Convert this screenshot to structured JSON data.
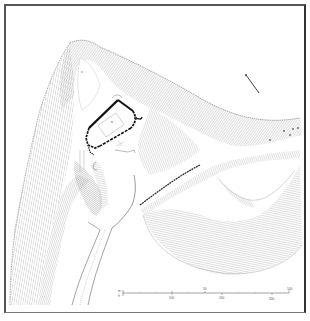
{
  "figure": {
    "type": "earthwork survey plan",
    "colors": {
      "ink": "#222222",
      "hachure": "#9a9a9a",
      "frame": "#555555",
      "background": "#ffffff"
    }
  },
  "north_arrow": {
    "icon": "north-arrow-icon"
  },
  "scale_bar": {
    "metric_unit": "m",
    "imperial_unit": "ft",
    "metric_ticks": [
      "50",
      "100"
    ],
    "imperial_ticks": [
      "100",
      "200",
      "300"
    ]
  }
}
